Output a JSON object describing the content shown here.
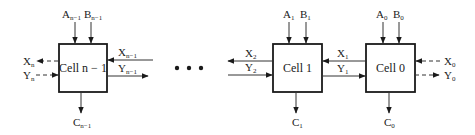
{
  "diagram": {
    "type": "ripple-carry cell chain",
    "colors": {
      "stroke": "#1a1a1a",
      "wire": "#333333",
      "background": "#ffffff"
    },
    "ellipsis": "• • •",
    "cells": [
      {
        "id": "cell-n-1",
        "label": "Cell n − 1",
        "inputs_top": [
          {
            "base": "A",
            "sub": "n−1"
          },
          {
            "base": "B",
            "sub": "n−1"
          }
        ],
        "output_bottom": {
          "base": "C",
          "sub": "n−1"
        },
        "left_signals": [
          {
            "base": "X",
            "sub": "n",
            "direction": "out",
            "style": "dashed"
          },
          {
            "base": "Y",
            "sub": "n",
            "direction": "in",
            "style": "dashed"
          }
        ],
        "right_signals": [
          {
            "base": "X",
            "sub": "n−1",
            "direction": "in",
            "style": "solid"
          },
          {
            "base": "Y",
            "sub": "n−1",
            "direction": "out",
            "style": "solid"
          }
        ]
      },
      {
        "id": "cell-1",
        "label": "Cell 1",
        "inputs_top": [
          {
            "base": "A",
            "sub": "1"
          },
          {
            "base": "B",
            "sub": "1"
          }
        ],
        "output_bottom": {
          "base": "C",
          "sub": "1"
        },
        "left_signals": [
          {
            "base": "X",
            "sub": "2",
            "direction": "out",
            "style": "solid"
          },
          {
            "base": "Y",
            "sub": "2",
            "direction": "in",
            "style": "solid"
          }
        ]
      },
      {
        "id": "cell-0",
        "label": "Cell 0",
        "inputs_top": [
          {
            "base": "A",
            "sub": "0"
          },
          {
            "base": "B",
            "sub": "0"
          }
        ],
        "output_bottom": {
          "base": "C",
          "sub": "0"
        },
        "left_signals": [
          {
            "base": "X",
            "sub": "1",
            "direction": "out",
            "style": "solid"
          },
          {
            "base": "Y",
            "sub": "1",
            "direction": "in",
            "style": "solid"
          }
        ],
        "right_signals": [
          {
            "base": "X",
            "sub": "0",
            "direction": "in",
            "style": "dashed"
          },
          {
            "base": "Y",
            "sub": "0",
            "direction": "out",
            "style": "dashed"
          }
        ]
      }
    ]
  },
  "labels": {
    "cell_n1": "Cell n − 1",
    "cell_1": "Cell 1",
    "cell_0": "Cell 0",
    "A": "A",
    "B": "B",
    "C": "C",
    "X": "X",
    "Y": "Y",
    "sub_n1": "n−1",
    "sub_n": "n",
    "sub_2": "2",
    "sub_1": "1",
    "sub_0": "0"
  }
}
